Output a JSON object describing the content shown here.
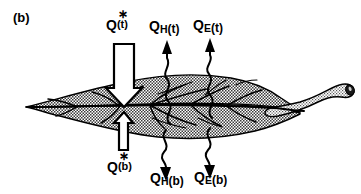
{
  "figure": {
    "panel_label": "(b)",
    "background_color": "#ffffff",
    "ink_color": "#000000",
    "leaf_fill_color": "#b5b5b5"
  },
  "labels": {
    "net_radiation_top": {
      "symbol": "Q",
      "superscript": "∗",
      "subscript": "(t)",
      "full_text": "Q*(t)"
    },
    "net_radiation_bottom": {
      "symbol": "Q",
      "superscript": "∗",
      "subscript": "(b)",
      "full_text": "Q*(b)"
    },
    "sensible_heat_top": {
      "symbol": "Q",
      "subscript": "H",
      "suffix": "(t)",
      "full_text": "QH(t)"
    },
    "latent_heat_top": {
      "symbol": "Q",
      "subscript": "E",
      "suffix": "(t)",
      "full_text": "QE(t)"
    },
    "sensible_heat_bottom": {
      "symbol": "Q",
      "subscript": "H",
      "suffix": "(b)",
      "full_text": "QH(b)"
    },
    "latent_heat_bottom": {
      "symbol": "Q",
      "subscript": "E",
      "suffix": "(b)",
      "full_text": "QE(b)"
    }
  },
  "arrows": {
    "net_radiation_top_arrow": {
      "style": "hollow-block-arrow",
      "direction": "down",
      "target": "leaf-top-surface"
    },
    "net_radiation_bottom_arrow": {
      "style": "hollow-block-arrow",
      "direction": "up",
      "target": "leaf-bottom-surface"
    },
    "sensible_heat_top_arrow": {
      "style": "wavy",
      "direction": "up",
      "origin": "leaf-top-surface"
    },
    "latent_heat_top_arrow": {
      "style": "wavy",
      "direction": "up",
      "origin": "leaf-top-surface"
    },
    "sensible_heat_bottom_arrow": {
      "style": "wavy",
      "direction": "down",
      "origin": "leaf-bottom-surface"
    },
    "latent_heat_bottom_arrow": {
      "style": "wavy",
      "direction": "down",
      "origin": "leaf-bottom-surface"
    }
  },
  "leaf": {
    "orientation": "horizontal",
    "tip_side": "left",
    "petiole_side": "right",
    "shading": "stipple-halftone",
    "has_midrib": true,
    "has_secondary_veins": true
  }
}
